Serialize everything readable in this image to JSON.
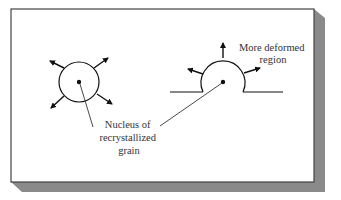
{
  "diagram": {
    "labels": {
      "nucleus": [
        "Nucleus of",
        "recrystallized",
        "grain"
      ],
      "deformed": [
        "More deformed",
        "region"
      ]
    },
    "colors": {
      "frame": "#444444",
      "shadow": "#8a8a8a",
      "ink": "#111111",
      "text": "#333333",
      "background": "#ffffff"
    }
  }
}
